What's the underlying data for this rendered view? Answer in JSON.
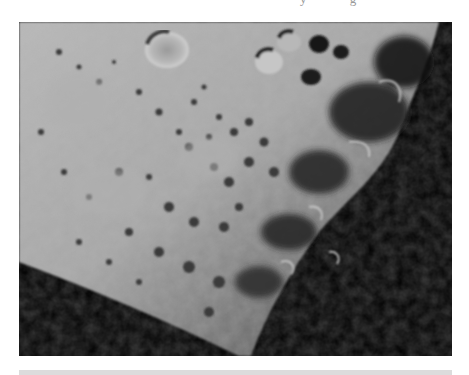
{
  "page": {
    "cut_off_text": "y g"
  },
  "figure": {
    "colors": {
      "highlands_light": "#b4b4b4",
      "highlands_mid": "#9c9c9c",
      "shadow": "#000000",
      "crater_shadow": "#2a2a2a"
    }
  },
  "caption_bar": {
    "color": "#dcdcdc"
  }
}
